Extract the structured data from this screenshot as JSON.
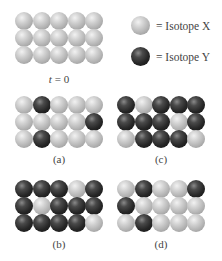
{
  "legend": [
    {
      "isotope": "X",
      "label": "= Isotope X",
      "color": "#c4c4c4"
    },
    {
      "isotope": "Y",
      "label": "= Isotope Y",
      "color": "#262626"
    }
  ],
  "panels": {
    "t0": {
      "label_var": "t",
      "label_rest": " = 0",
      "rows": [
        [
          "X",
          "X",
          "X",
          "X",
          "X"
        ],
        [
          "X",
          "X",
          "X",
          "X",
          "X"
        ],
        [
          "X",
          "X",
          "X",
          "X",
          "X"
        ]
      ]
    },
    "a": {
      "label": "(a)",
      "rows": [
        [
          "X",
          "Y",
          "X",
          "X",
          "X"
        ],
        [
          "X",
          "X",
          "X",
          "X",
          "Y"
        ],
        [
          "X",
          "Y",
          "X",
          "X",
          "X"
        ]
      ]
    },
    "c": {
      "label": "(c)",
      "rows": [
        [
          "Y",
          "X",
          "Y",
          "Y",
          "Y"
        ],
        [
          "Y",
          "Y",
          "Y",
          "X",
          "Y"
        ],
        [
          "X",
          "Y",
          "Y",
          "Y",
          "X"
        ]
      ]
    },
    "b": {
      "label": "(b)",
      "rows": [
        [
          "Y",
          "Y",
          "Y",
          "X",
          "Y"
        ],
        [
          "Y",
          "X",
          "Y",
          "Y",
          "Y"
        ],
        [
          "Y",
          "Y",
          "Y",
          "Y",
          "X"
        ]
      ]
    },
    "d": {
      "label": "(d)",
      "rows": [
        [
          "X",
          "Y",
          "X",
          "X",
          "Y"
        ],
        [
          "Y",
          "X",
          "X",
          "X",
          "X"
        ],
        [
          "X",
          "Y",
          "X",
          "X",
          "X"
        ]
      ]
    }
  }
}
